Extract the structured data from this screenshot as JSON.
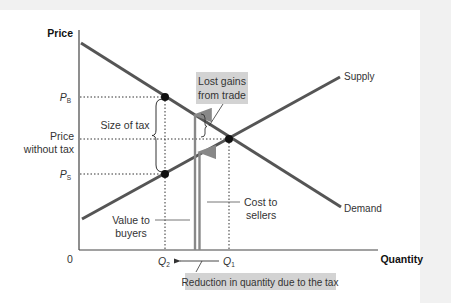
{
  "diagram": {
    "axes": {
      "y_label": "Price",
      "x_label": "Quantity",
      "origin_label": "0"
    },
    "curves": {
      "supply_label": "Supply",
      "demand_label": "Demand"
    },
    "price_labels": {
      "buyers_price": "P",
      "buyers_sub": "B",
      "no_tax_line1": "Price",
      "no_tax_line2": "without tax",
      "sellers_price": "P",
      "sellers_sub": "S"
    },
    "quantity_labels": {
      "q2": "Q",
      "q2_sub": "2",
      "q1": "Q",
      "q1_sub": "1"
    },
    "annotations": {
      "size_of_tax": "Size of tax",
      "lost_gains_line1": "Lost gains",
      "lost_gains_line2": "from trade",
      "value_to_buyers_line1": "Value to",
      "value_to_buyers_line2": "buyers",
      "cost_to_sellers_line1": "Cost to",
      "cost_to_sellers_line2": "sellers",
      "reduction": "Reduction in quantity due to the tax"
    },
    "colors": {
      "curve": "#555555",
      "axis": "#444444",
      "arrow": "#888888",
      "highlight_box": "#d3d3d3",
      "background": "#f1f1f1",
      "panel": "#ffffff"
    }
  }
}
